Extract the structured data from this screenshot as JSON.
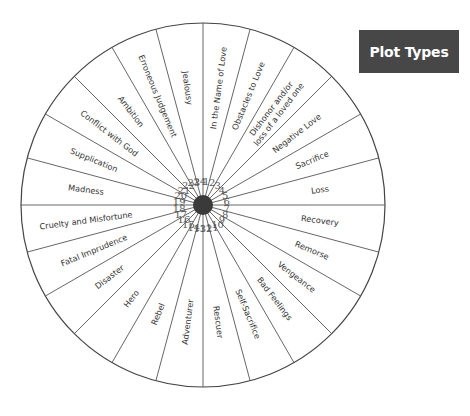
{
  "title": "Plot Types",
  "wheel": {
    "center": [
      203,
      205
    ],
    "radius": 182,
    "hub_color": "#3a3a3a",
    "line_color": "#555555",
    "sectors": [
      {
        "num": "1",
        "label": [
          "In the Name of Love"
        ]
      },
      {
        "num": "2",
        "label": [
          "Obstacles to Love"
        ]
      },
      {
        "num": "3",
        "label": [
          "Dishonor and/or",
          "loss of a loved one"
        ]
      },
      {
        "num": "4",
        "label": [
          "Negative Love"
        ]
      },
      {
        "num": "5",
        "label": [
          "Sacrifice"
        ]
      },
      {
        "num": "6",
        "label": [
          "Loss"
        ]
      },
      {
        "num": "7",
        "label": [
          "Recovery"
        ]
      },
      {
        "num": "8",
        "label": [
          "Remorse"
        ]
      },
      {
        "num": "9",
        "label": [
          "Vengeance"
        ]
      },
      {
        "num": "10",
        "label": [
          "Bad Feelings"
        ]
      },
      {
        "num": "11",
        "label": [
          "Self-Sacrifice"
        ]
      },
      {
        "num": "12",
        "label": [
          "Rescuer"
        ]
      },
      {
        "num": "13",
        "label": [
          "Adventurer"
        ]
      },
      {
        "num": "14",
        "label": [
          "Rebel"
        ]
      },
      {
        "num": "15",
        "label": [
          "Hero"
        ]
      },
      {
        "num": "16",
        "label": [
          "Disaster"
        ]
      },
      {
        "num": "17",
        "label": [
          "Fatal Imprudence"
        ]
      },
      {
        "num": "18",
        "label": [
          "Cruelty and Misfortune"
        ]
      },
      {
        "num": "19",
        "label": [
          "Madness"
        ]
      },
      {
        "num": "20",
        "label": [
          "Supplication"
        ]
      },
      {
        "num": "21",
        "label": [
          "Conflict with God"
        ]
      },
      {
        "num": "22",
        "label": [
          "Ambition"
        ]
      },
      {
        "num": "23",
        "label": [
          "Erroneous Judgement"
        ]
      },
      {
        "num": "24",
        "label": [
          "Jealousy"
        ]
      }
    ]
  }
}
